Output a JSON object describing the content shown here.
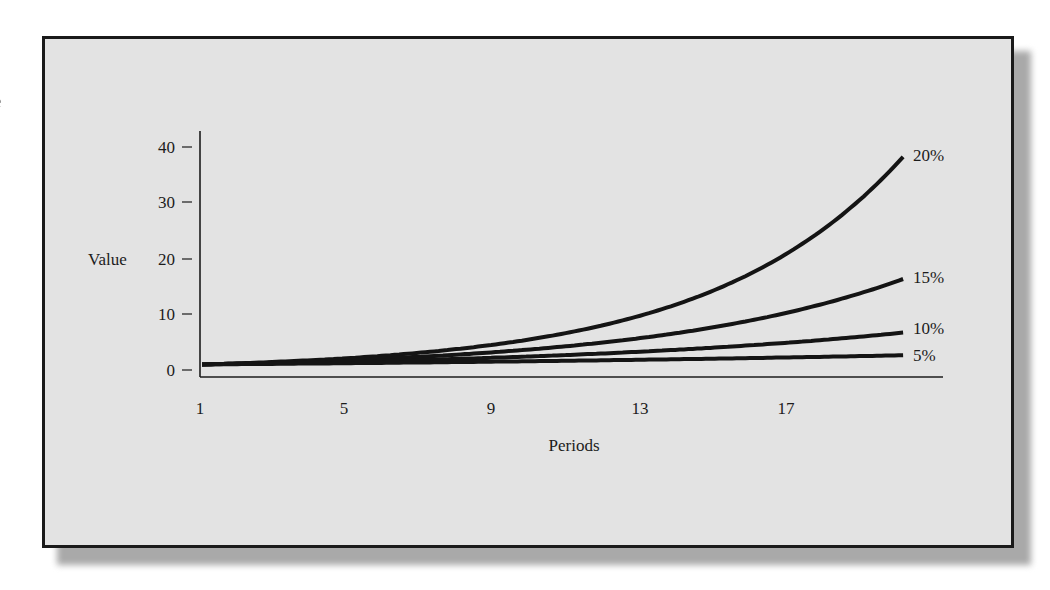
{
  "page": {
    "edge_fragment": "e"
  },
  "chart_data": {
    "type": "line",
    "title": "",
    "xlabel": "Periods",
    "ylabel": "Value",
    "x_ticks": [
      "1",
      "5",
      "9",
      "13",
      "17"
    ],
    "y_ticks": [
      "0",
      "10",
      "20",
      "30",
      "40"
    ],
    "xlim": [
      1,
      20
    ],
    "ylim": [
      0,
      40
    ],
    "grid": false,
    "legend": "inline labels at right end of each line",
    "x": [
      1,
      2,
      3,
      4,
      5,
      6,
      7,
      8,
      9,
      10,
      11,
      12,
      13,
      14,
      15,
      16,
      17,
      18,
      19,
      20
    ],
    "series": [
      {
        "name": "20%",
        "rate": 0.2,
        "values": [
          1.2,
          1.44,
          1.73,
          2.07,
          2.49,
          2.99,
          3.58,
          4.3,
          5.16,
          6.19,
          7.43,
          8.92,
          10.7,
          12.84,
          15.41,
          18.49,
          22.19,
          26.62,
          31.95,
          38.34
        ]
      },
      {
        "name": "15%",
        "rate": 0.15,
        "values": [
          1.15,
          1.32,
          1.52,
          1.75,
          2.01,
          2.31,
          2.66,
          3.06,
          3.52,
          4.05,
          4.65,
          5.35,
          6.15,
          7.08,
          8.14,
          9.36,
          10.76,
          12.38,
          14.23,
          16.37
        ]
      },
      {
        "name": "10%",
        "rate": 0.1,
        "values": [
          1.1,
          1.21,
          1.33,
          1.46,
          1.61,
          1.77,
          1.95,
          2.14,
          2.36,
          2.59,
          2.85,
          3.14,
          3.45,
          3.8,
          4.18,
          4.59,
          5.05,
          5.56,
          6.12,
          6.73
        ]
      },
      {
        "name": "5%",
        "rate": 0.05,
        "values": [
          1.05,
          1.1,
          1.16,
          1.22,
          1.28,
          1.34,
          1.41,
          1.48,
          1.55,
          1.63,
          1.71,
          1.8,
          1.89,
          1.98,
          2.08,
          2.18,
          2.29,
          2.41,
          2.53,
          2.65
        ]
      }
    ]
  },
  "style": {
    "panel_bg": "#e3e3e3",
    "border": "#1a1a1a",
    "line_color": "#141414",
    "shadow": "#a9a9a9"
  }
}
